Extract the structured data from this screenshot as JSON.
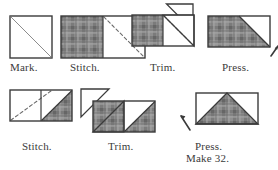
{
  "figure": {
    "background_color": "#ffffff",
    "line_color": "#3b3b3b",
    "plaid_color": "#8e8e8e",
    "plaid_line_color": "#5a5a5a",
    "white_fabric_color": "#ffffff",
    "dashed_stitch_color": "#6b6b6b"
  },
  "rows": [
    {
      "id": "row-1",
      "steps": [
        {
          "id": "step-mark",
          "label": "Mark.",
          "shape": "square",
          "description": "White square with marked diagonal line corner to corner"
        },
        {
          "id": "step-stitch-1",
          "label": "Stitch.",
          "shape": "rectangle",
          "description": "Plaid square at left, white square at right with dashed stitching line on diagonal"
        },
        {
          "id": "step-trim-1",
          "label": "Trim.",
          "shape": "rectangle-with-flap",
          "description": "Unit with trimmed white triangle folded open above the seam"
        },
        {
          "id": "step-press-1",
          "label": "Press.",
          "shape": "rectangle-pressed",
          "description": "Plaid rectangle with white triangle pressed to upper right, press arrow at lower right"
        }
      ]
    },
    {
      "id": "row-2",
      "steps": [
        {
          "id": "step-stitch-2",
          "label": "Stitch.",
          "shape": "rectangle",
          "description": "White rectangle with dashed stitching line and plaid triangle at right"
        },
        {
          "id": "step-trim-2",
          "label": "Trim.",
          "shape": "rectangle-with-flap",
          "description": "Unit with trimmed plaid triangle folded open to the upper left"
        },
        {
          "id": "step-press-2",
          "label": "Press.",
          "label_line2": "Make 32.",
          "shape": "flying-geese",
          "description": "Finished flying geese unit, plaid triangle centered, press arrow at lower left"
        }
      ]
    }
  ]
}
